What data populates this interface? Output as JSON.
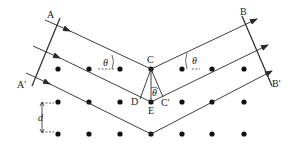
{
  "diagram": {
    "labels": {
      "A": "A",
      "A_prime": "A'",
      "B": "B",
      "B_prime": "B'",
      "C": "C",
      "C_prime": "C'",
      "D": "D",
      "E": "E",
      "theta": "θ",
      "d": "d"
    },
    "lattice": {
      "columns_x": [
        58,
        89,
        120,
        151,
        182,
        212,
        244
      ],
      "rows_y": [
        69,
        102,
        133
      ]
    },
    "colors": {
      "line": "#2a2a2a",
      "dot": "#111111",
      "background": "#ffffff"
    }
  }
}
